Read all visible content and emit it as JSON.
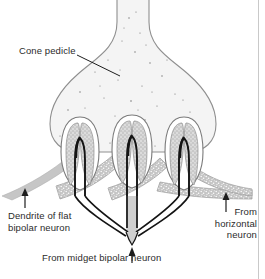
{
  "figure": {
    "type": "histological-line-diagram",
    "background_color": "#ffffff",
    "outline_color": "#8a8a8a",
    "cytoplasm_color": "#f2f2f2",
    "stipple_color": "#b8b8b8",
    "dendrite_dark_color": "#1a1a1a",
    "dendrite_gray_color": "#bdbdbd",
    "text_color": "#2b2b2b",
    "border_color": "#c9c9c9"
  },
  "labels": {
    "cone_pedicle": "Cone pedicle",
    "flat_bipolar_line1": "Dendrite of flat",
    "flat_bipolar_line2": "bipolar neuron",
    "horizontal_line1": "From",
    "horizontal_line2": "horizontal",
    "horizontal_line3": "neuron",
    "midget_bipolar": "From midget bipolar neuron"
  },
  "structures": {
    "pedicle_label": "cone-pedicle-body",
    "triads": [
      {
        "name": "triad-left",
        "cx": 80
      },
      {
        "name": "triad-center",
        "cx": 132
      },
      {
        "name": "triad-right",
        "cx": 184
      }
    ],
    "arrows": [
      {
        "name": "arrow-flat-bipolar",
        "x": 25,
        "points_to": "flat bipolar dendrite"
      },
      {
        "name": "arrow-horizontal-neuron",
        "x": 226,
        "points_to": "horizontal cell process"
      },
      {
        "name": "arrow-midget-bipolar",
        "x": 132,
        "points_to": "midget bipolar dendrite trunk"
      }
    ]
  }
}
